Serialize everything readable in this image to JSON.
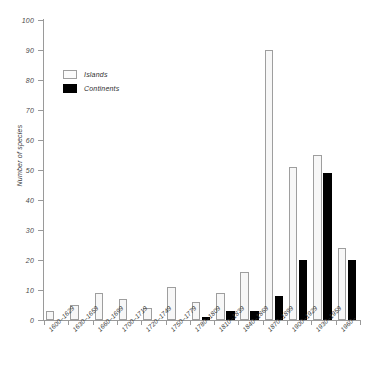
{
  "chart_data": {
    "type": "bar",
    "title": "",
    "xlabel": "",
    "ylabel": "Number of species",
    "ylim": [
      0,
      100
    ],
    "yticks": [
      0,
      10,
      20,
      30,
      40,
      50,
      60,
      70,
      80,
      90,
      100
    ],
    "grid": false,
    "legend_position": "upper-left",
    "categories": [
      "1600–1629",
      "1630–1659",
      "1660–1699",
      "1700–1719",
      "1720–1749",
      "1750–1779",
      "1780–1809",
      "1810–1839",
      "1840–1869",
      "1870–1899",
      "1900–1929",
      "1930–1959",
      "1960–"
    ],
    "series": [
      {
        "name": "Islands",
        "color": "#f7f7f7",
        "values": [
          3,
          5,
          9,
          7,
          4,
          11,
          6,
          9,
          16,
          90,
          51,
          55,
          24
        ]
      },
      {
        "name": "Continents",
        "color": "#000000",
        "values": [
          0,
          0,
          0,
          0,
          0,
          0,
          1,
          3,
          3,
          8,
          20,
          49,
          20
        ]
      }
    ]
  },
  "legend": {
    "items": [
      {
        "label": "Islands",
        "swatch": "islands"
      },
      {
        "label": "Continents",
        "swatch": "continents"
      }
    ]
  },
  "axis": {
    "y_title": "Number of species"
  }
}
